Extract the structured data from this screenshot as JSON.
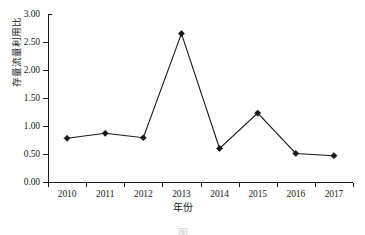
{
  "chart_data": {
    "type": "line",
    "title": "",
    "subtitle": "",
    "xlabel": "年份",
    "ylabel": "存量流量利用比",
    "categories": [
      "2010",
      "2011",
      "2012",
      "2013",
      "2014",
      "2015",
      "2016",
      "2017"
    ],
    "values": [
      0.78,
      0.87,
      0.79,
      2.65,
      0.6,
      1.23,
      0.51,
      0.47
    ],
    "series": [
      {
        "name": "存量流量利用比",
        "values": [
          0.78,
          0.87,
          0.79,
          2.65,
          0.6,
          1.23,
          0.51,
          0.47
        ]
      }
    ],
    "ylim": [
      0.0,
      3.0
    ],
    "ytick_labels": [
      "0.00",
      "0.50",
      "1.00",
      "1.50",
      "2.00",
      "2.50",
      "3.00"
    ],
    "ytick_values": [
      0.0,
      0.5,
      1.0,
      1.5,
      2.0,
      2.5,
      3.0
    ],
    "xtick_labels": [
      "2010",
      "2011",
      "2012",
      "2013",
      "2014",
      "2015",
      "2016",
      "2017"
    ],
    "grid": false,
    "legend": false,
    "legend_position": "none",
    "marker": "diamond",
    "line_color": "#1a1a1a",
    "marker_color": "#1a1a1a",
    "background_color": "#ffffff",
    "axis_color": "#1a1a1a"
  },
  "caption": {
    "text": "图"
  }
}
